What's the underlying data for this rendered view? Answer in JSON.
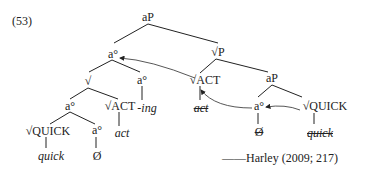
{
  "example_number": "(53)",
  "citation": "——Harley (2009; 217)",
  "tree": {
    "root": "aP",
    "left_a": "a°",
    "sqrt": "√",
    "a_ing": "a°",
    "ing": "-ing",
    "a_inner": "a°",
    "sqrt_act_left": "√ACT",
    "act_left": "act",
    "sqrt_quick_left": "√QUICK",
    "quick_left": "quick",
    "a_zero_left": "a°",
    "zero_left": "Ø",
    "sqrtP": "√P",
    "sqrt_act_right": "√ACT",
    "act_right": "act",
    "aP_right": "aP",
    "a_right": "a°",
    "zero_right": "Ø",
    "sqrt_quick_right": "√QUICK",
    "quick_right": "quick"
  }
}
